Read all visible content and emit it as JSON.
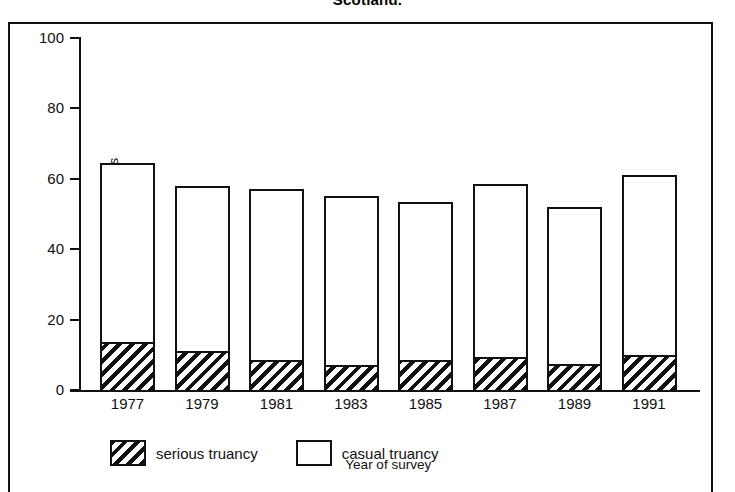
{
  "figure": {
    "title": "Scotland.",
    "frame": true
  },
  "chart_data": {
    "type": "bar",
    "subtype": "stacked-vertical",
    "title": "Scotland.",
    "xlabel": "Year of survey",
    "ylabel": "Percentage of leavers",
    "categories": [
      "1977",
      "1979",
      "1981",
      "1983",
      "1985",
      "1987",
      "1989",
      "1991"
    ],
    "series": [
      {
        "name": "serious truancy",
        "fill": "hatched-diagonal",
        "values": [
          13.5,
          11.0,
          8.5,
          7.0,
          8.5,
          9.5,
          7.5,
          10.0
        ]
      },
      {
        "name": "casual truancy",
        "fill": "white",
        "values": [
          51.0,
          47.0,
          48.5,
          48.0,
          45.0,
          49.0,
          44.5,
          51.0
        ]
      }
    ],
    "totals": [
      64.5,
      58.0,
      57.0,
      55.0,
      53.5,
      58.5,
      52.0,
      61.0
    ],
    "ylim": [
      0,
      100
    ],
    "yticks": [
      0,
      20,
      40,
      60,
      80,
      100
    ],
    "ytick_labels": [
      "0",
      "20",
      "40",
      "60",
      "80",
      "100"
    ],
    "grid": false,
    "legend_position": "below-axes",
    "colors": {
      "ink": "#111111",
      "background": "#ffffff"
    }
  },
  "axes": {
    "y_title": "Percentage of leavers",
    "x_title": "Year of survey"
  },
  "legend": {
    "entries": [
      {
        "label": "serious truancy",
        "fill": "hatched"
      },
      {
        "label": "casual truancy",
        "fill": "white"
      }
    ]
  }
}
